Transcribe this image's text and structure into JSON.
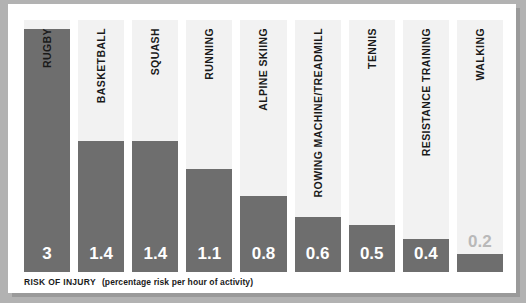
{
  "caption": {
    "title": "RISK OF INJURY",
    "note": "(percentage risk per hour of activity)"
  },
  "colors": {
    "bar": "#6e6e6e",
    "column_background": "#f2f2f2",
    "panel_background": "#ffffff",
    "frame": "#b2b2b2",
    "value_label": "#ffffff",
    "value_label_outside": "#b9b9b9",
    "category_label": "#1a1a1a"
  },
  "chart_data": {
    "type": "bar",
    "title": "RISK OF INJURY",
    "subtitle": "(percentage risk per hour of activity)",
    "xlabel": "",
    "ylabel": "percentage risk per hour of activity",
    "orientation": "vertical",
    "grid": false,
    "legend": "none",
    "ylim": [
      0,
      3
    ],
    "categories": [
      "RUGBY",
      "BASKETBALL",
      "SQUASH",
      "RUNNING",
      "ALPINE SKIING",
      "ROWING MACHINE/TREADMILL",
      "TENNIS",
      "RESISTANCE TRAINING",
      "WALKING"
    ],
    "values": [
      3,
      1.4,
      1.4,
      1.1,
      0.8,
      0.6,
      0.5,
      0.4,
      0.2
    ],
    "value_labels": [
      "3",
      "1.4",
      "1.4",
      "1.1",
      "0.8",
      "0.6",
      "0.5",
      "0.4",
      "0.2"
    ],
    "bars": [
      {
        "category": "RUGBY",
        "value": 3,
        "label": "3",
        "label_inside": true,
        "bar_height_pct": 96.5
      },
      {
        "category": "BASKETBALL",
        "value": 1.4,
        "label": "1.4",
        "label_inside": true,
        "bar_height_pct": 52.0
      },
      {
        "category": "SQUASH",
        "value": 1.4,
        "label": "1.4",
        "label_inside": true,
        "bar_height_pct": 52.0
      },
      {
        "category": "RUNNING",
        "value": 1.1,
        "label": "1.1",
        "label_inside": true,
        "bar_height_pct": 41.0
      },
      {
        "category": "ALPINE SKIING",
        "value": 0.8,
        "label": "0.8",
        "label_inside": true,
        "bar_height_pct": 30.0
      },
      {
        "category": "ROWING MACHINE/TREADMILL",
        "value": 0.6,
        "label": "0.6",
        "label_inside": true,
        "bar_height_pct": 22.0
      },
      {
        "category": "TENNIS",
        "value": 0.5,
        "label": "0.5",
        "label_inside": true,
        "bar_height_pct": 18.5
      },
      {
        "category": "RESISTANCE TRAINING",
        "value": 0.4,
        "label": "0.4",
        "label_inside": true,
        "bar_height_pct": 13.0
      },
      {
        "category": "WALKING",
        "value": 0.2,
        "label": "0.2",
        "label_inside": false,
        "bar_height_pct": 7.0
      }
    ]
  }
}
